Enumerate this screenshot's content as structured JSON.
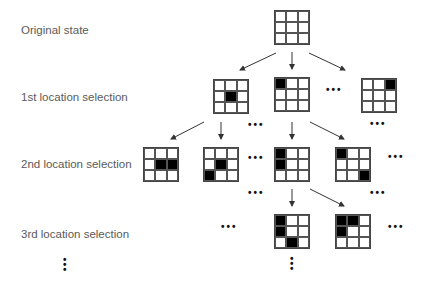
{
  "labels": {
    "original": "Original state",
    "first": "1st location selection",
    "second": "2nd location selection",
    "third": "3rd location selection"
  },
  "ellipsis_h": "•••",
  "colors": {
    "filled": "#000000",
    "grid_line": "#444444",
    "label": "#5a5a5a",
    "arrow": "#333333"
  },
  "grids": [
    {
      "id": "original",
      "x": 274,
      "y": 10,
      "filled": []
    },
    {
      "id": "r1-a",
      "x": 213,
      "y": 79,
      "filled": [
        4
      ]
    },
    {
      "id": "r1-b",
      "x": 274,
      "y": 77,
      "filled": [
        0
      ]
    },
    {
      "id": "r1-c",
      "x": 361,
      "y": 78,
      "filled": [
        2
      ]
    },
    {
      "id": "r2-a",
      "x": 143,
      "y": 147,
      "filled": [
        4,
        5
      ]
    },
    {
      "id": "r2-b",
      "x": 203,
      "y": 147,
      "filled": [
        4,
        6
      ]
    },
    {
      "id": "r2-c",
      "x": 274,
      "y": 147,
      "filled": [
        0,
        3
      ]
    },
    {
      "id": "r2-d",
      "x": 335,
      "y": 147,
      "filled": [
        0,
        8
      ]
    },
    {
      "id": "r3-a",
      "x": 274,
      "y": 214,
      "filled": [
        0,
        3,
        7
      ]
    },
    {
      "id": "r3-b",
      "x": 335,
      "y": 214,
      "filled": [
        0,
        1,
        3
      ]
    }
  ],
  "arrows": [
    {
      "x1": 276,
      "y1": 53,
      "x2": 240,
      "y2": 70
    },
    {
      "x1": 292,
      "y1": 52,
      "x2": 292,
      "y2": 69
    },
    {
      "x1": 309,
      "y1": 53,
      "x2": 345,
      "y2": 70
    },
    {
      "x1": 204,
      "y1": 122,
      "x2": 171,
      "y2": 139
    },
    {
      "x1": 221,
      "y1": 122,
      "x2": 221,
      "y2": 139
    },
    {
      "x1": 292,
      "y1": 122,
      "x2": 292,
      "y2": 139
    },
    {
      "x1": 310,
      "y1": 122,
      "x2": 344,
      "y2": 139
    },
    {
      "x1": 292,
      "y1": 189,
      "x2": 292,
      "y2": 206
    },
    {
      "x1": 310,
      "y1": 189,
      "x2": 344,
      "y2": 206
    }
  ],
  "dots_h": [
    {
      "x": 326,
      "y": 86
    },
    {
      "x": 370,
      "y": 120
    },
    {
      "x": 248,
      "y": 121
    },
    {
      "x": 248,
      "y": 154
    },
    {
      "x": 388,
      "y": 153
    },
    {
      "x": 248,
      "y": 189
    },
    {
      "x": 370,
      "y": 189
    },
    {
      "x": 221,
      "y": 223
    },
    {
      "x": 388,
      "y": 223
    }
  ],
  "dots_v": [
    {
      "x": 63,
      "y": 257
    },
    {
      "x": 290,
      "y": 256
    }
  ]
}
